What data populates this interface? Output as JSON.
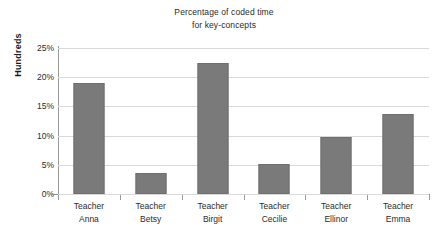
{
  "chart_data": {
    "type": "bar",
    "title": "Percentage of coded time for key-concepts",
    "title_lines": [
      "Percentage of coded time",
      "for key-concepts"
    ],
    "xlabel": "",
    "ylabel": "Hundreds",
    "categories": [
      "Teacher Anna",
      "Teacher Betsy",
      "Teacher Birgit",
      "Teacher Cecilie",
      "Teacher Ellinor",
      "Teacher Emma"
    ],
    "category_lines": [
      [
        "Teacher",
        "Anna"
      ],
      [
        "Teacher",
        "Betsy"
      ],
      [
        "Teacher",
        "Birgit"
      ],
      [
        "Teacher",
        "Cecilie"
      ],
      [
        "Teacher",
        "Ellinor"
      ],
      [
        "Teacher",
        "Emma"
      ]
    ],
    "values": [
      19.0,
      3.6,
      22.5,
      5.1,
      9.8,
      13.7
    ],
    "value_unit": "%",
    "ylim": [
      0,
      25
    ],
    "ytick_values": [
      0,
      5,
      10,
      15,
      20,
      25
    ],
    "ytick_labels": [
      "0%",
      "5%",
      "10%",
      "15%",
      "20%",
      "25%"
    ],
    "grid": true,
    "grid_axis": "y",
    "legend": false,
    "legend_position": "none",
    "bar_color": "#7a7a7a",
    "gridline_color": "#d9d9d9",
    "axis_color": "#9a9a9a",
    "background_color": "#ffffff",
    "text_color": "#2b2b2b"
  }
}
